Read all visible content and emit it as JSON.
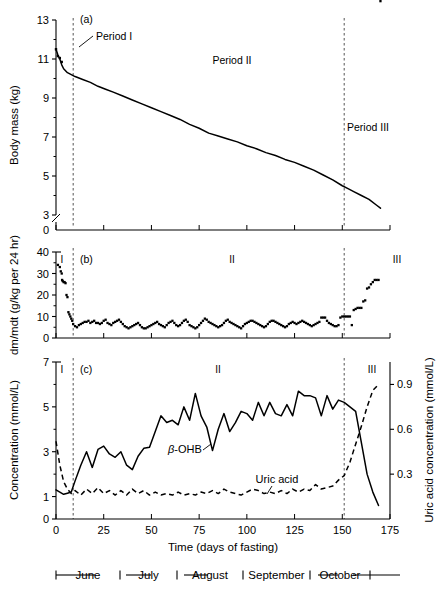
{
  "figure": {
    "panels": [
      {
        "key": "a",
        "label": "(a)",
        "ylabel": "Body mass (kg)",
        "yticks": [
          "13",
          "11",
          "9",
          "7",
          "5",
          "3",
          "0"
        ],
        "annotations": {
          "period1": "Period I",
          "period2": "Period II",
          "period3": "Period III"
        }
      },
      {
        "key": "b",
        "label": "(b)",
        "ylabel": "dm/mdt (g/kg per 24 hr)",
        "yticks": [
          "40",
          "30",
          "20",
          "10",
          "0"
        ],
        "romans": [
          "I",
          "II",
          "III"
        ]
      },
      {
        "key": "c",
        "label": "(c)",
        "ylabel": "Concentration (mmol/L)",
        "ylabel_right": "Uric acid concentration (mmol/L)",
        "yticks": [
          "7",
          "5",
          "3",
          "1",
          "0"
        ],
        "yticks_right": [
          "0.9",
          "0.6",
          "0.3"
        ],
        "romans": [
          "I",
          "II",
          "III"
        ],
        "series_labels": {
          "bohb": "-OHB",
          "bohb_prefix": "β",
          "uric": "Uric acid"
        }
      }
    ],
    "xaxis": {
      "title": "Time (days of fasting)",
      "ticks": [
        "0",
        "25",
        "50",
        "75",
        "100",
        "125",
        "150",
        "175"
      ],
      "tickvals": [
        0,
        25,
        50,
        75,
        100,
        125,
        150,
        175
      ]
    },
    "month_legend": {
      "months": [
        "June",
        "July",
        "August",
        "September",
        "October"
      ]
    },
    "colors": {
      "line": "#000000",
      "dashed_divider": "#555555",
      "axis": "#000000",
      "background": "#ffffff"
    }
  },
  "chart_data": {
    "type": "line",
    "title": "",
    "xlabel": "Time (days of fasting)",
    "xlim": [
      0,
      175
    ],
    "grid": false,
    "legend": "inline-annotations",
    "period_boundaries": [
      9,
      151
    ],
    "panels": [
      {
        "id": "a",
        "type": "line",
        "ylabel": "Body mass (kg)",
        "ylim": [
          3,
          13
        ],
        "yticks": [
          3,
          5,
          7,
          9,
          11,
          13
        ],
        "axis_break_below": 3,
        "series": [
          {
            "name": "Body mass",
            "style": "solid",
            "x": [
              0,
              1,
              2,
              3,
              4,
              6,
              8,
              10,
              14,
              18,
              22,
              26,
              30,
              35,
              40,
              45,
              50,
              55,
              60,
              65,
              70,
              75,
              80,
              85,
              90,
              95,
              100,
              105,
              110,
              115,
              120,
              125,
              130,
              135,
              140,
              145,
              150,
              153,
              156,
              160,
              164,
              168,
              170
            ],
            "values": [
              11.5,
              11.2,
              11.0,
              10.7,
              10.5,
              10.3,
              10.2,
              10.1,
              9.95,
              9.8,
              9.6,
              9.45,
              9.3,
              9.1,
              8.9,
              8.7,
              8.5,
              8.3,
              8.1,
              7.9,
              7.65,
              7.45,
              7.2,
              7.05,
              6.9,
              6.75,
              6.55,
              6.4,
              6.2,
              6.05,
              5.85,
              5.7,
              5.5,
              5.3,
              5.05,
              4.8,
              4.5,
              4.35,
              4.2,
              4.0,
              3.8,
              3.5,
              3.35
            ]
          },
          {
            "name": "Pre-fast points",
            "style": "points",
            "x": [
              0,
              1,
              2,
              3
            ],
            "values": [
              11.5,
              11.15,
              11.05,
              10.85
            ]
          }
        ]
      },
      {
        "id": "b",
        "type": "scatter",
        "ylabel": "dm/mdt (g/kg per 24 hr)",
        "ylim": [
          0,
          40
        ],
        "yticks": [
          0,
          10,
          20,
          30,
          40
        ],
        "series": [
          {
            "name": "Mass loss rate",
            "style": "points",
            "x": [
              1,
              2,
              2.5,
              3,
              3.2,
              3.5,
              4,
              4.5,
              5,
              5.5,
              6,
              6.5,
              7,
              7.5,
              8,
              8.5,
              9,
              10,
              11,
              12,
              13,
              14,
              15,
              16,
              17,
              18,
              19,
              20,
              21,
              22,
              23,
              24,
              25,
              26,
              27,
              28,
              29,
              30,
              31,
              32,
              33,
              34,
              35,
              36,
              37,
              38,
              39,
              40,
              41,
              42,
              43,
              44,
              45,
              46,
              47,
              48,
              49,
              50,
              51,
              52,
              53,
              54,
              55,
              56,
              57,
              58,
              59,
              60,
              61,
              62,
              63,
              64,
              65,
              66,
              67,
              68,
              69,
              70,
              71,
              72,
              73,
              74,
              75,
              76,
              77,
              78,
              79,
              80,
              81,
              82,
              83,
              84,
              85,
              86,
              87,
              88,
              89,
              90,
              91,
              92,
              93,
              94,
              95,
              96,
              97,
              98,
              99,
              100,
              101,
              102,
              103,
              104,
              105,
              106,
              107,
              108,
              109,
              110,
              111,
              112,
              113,
              114,
              115,
              116,
              117,
              118,
              119,
              120,
              121,
              122,
              123,
              124,
              125,
              126,
              127,
              128,
              129,
              130,
              131,
              132,
              133,
              134,
              135,
              136,
              137,
              138,
              139,
              140,
              141,
              142,
              143,
              144,
              145,
              146,
              147,
              148,
              149,
              150,
              151,
              152,
              153,
              154,
              155,
              156,
              157,
              158,
              159,
              160,
              161,
              162,
              163,
              164,
              165,
              166,
              167,
              168,
              169,
              170
            ],
            "values": [
              34,
              33,
              31,
              30,
              27,
              26.5,
              26,
              26,
              25.5,
              20,
              19,
              12,
              11,
              10,
              9,
              8,
              6.5,
              5.5,
              5,
              6,
              6.5,
              7,
              7.5,
              7.5,
              8,
              7,
              7.5,
              8,
              7,
              7,
              6.5,
              7,
              8,
              8.5,
              7,
              6.5,
              6,
              7,
              7.5,
              8,
              8.5,
              7.5,
              6.5,
              5.5,
              5,
              4.5,
              5,
              5.5,
              6,
              6.5,
              7,
              6,
              5,
              4.5,
              4.5,
              5,
              5.5,
              6,
              6.5,
              7,
              7.5,
              6.5,
              6,
              5.5,
              5,
              6,
              7,
              7.5,
              8,
              7,
              6,
              5.5,
              6,
              7,
              8,
              8.5,
              7.5,
              6,
              5.5,
              5,
              4.5,
              5,
              6,
              7,
              8,
              9,
              8.5,
              7.5,
              7,
              6.5,
              6,
              5.5,
              5,
              5.5,
              6,
              7,
              8,
              8.5,
              7.5,
              7,
              6.5,
              6,
              5.5,
              5,
              4.5,
              5.5,
              6.5,
              7,
              7.5,
              8,
              8,
              7.5,
              7,
              6.5,
              6,
              5.5,
              5,
              5.5,
              6.5,
              7.5,
              8,
              8,
              7.5,
              7,
              6.5,
              6,
              5.5,
              5,
              5.5,
              6.5,
              7,
              7.5,
              7,
              6.5,
              7,
              7.5,
              8,
              7.5,
              7,
              6.5,
              6,
              5.5,
              6,
              6.5,
              7,
              7.5,
              9.5,
              9.5,
              9.5,
              8,
              7,
              6.5,
              6,
              5.5,
              5.5,
              6,
              9.5,
              10,
              10,
              10,
              10,
              10,
              6,
              13,
              13.5,
              14,
              14,
              14,
              17,
              17.5,
              23,
              23.5,
              25,
              26,
              27,
              27,
              27
            ]
          }
        ]
      },
      {
        "id": "c",
        "type": "line",
        "ylabel": "Concentration (mmol/L)",
        "ylabel_right": "Uric acid concentration (mmol/L)",
        "ylim": [
          0,
          7
        ],
        "yticks": [
          0,
          1,
          3,
          5,
          7
        ],
        "ylim_right": [
          0,
          1.05
        ],
        "yticks_right": [
          0.3,
          0.6,
          0.9
        ],
        "series": [
          {
            "name": "β-OHB",
            "style": "solid",
            "axis": "left",
            "x": [
              0,
              2,
              4,
              6,
              8,
              10,
              13,
              16,
              19,
              22,
              25,
              28,
              31,
              34,
              37,
              40,
              43,
              46,
              49,
              52,
              55,
              58,
              61,
              64,
              67,
              70,
              73,
              76,
              79,
              82,
              85,
              88,
              91,
              94,
              97,
              100,
              103,
              106,
              109,
              112,
              115,
              118,
              121,
              124,
              127,
              130,
              133,
              136,
              139,
              142,
              145,
              148,
              151,
              154,
              157,
              160,
              163,
              166,
              169
            ],
            "values": [
              1.3,
              1.2,
              1.1,
              1.15,
              1.2,
              1.7,
              2.4,
              3.0,
              2.3,
              3.1,
              3.25,
              2.9,
              2.75,
              3.0,
              2.4,
              2.2,
              2.8,
              3.15,
              3.2,
              3.9,
              4.6,
              4.3,
              4.4,
              4.2,
              5.0,
              4.4,
              5.6,
              4.6,
              4.1,
              3.05,
              4.0,
              4.7,
              3.9,
              4.3,
              4.8,
              4.7,
              4.4,
              5.2,
              4.6,
              5.2,
              4.7,
              4.6,
              5.1,
              4.6,
              5.7,
              5.5,
              5.5,
              5.4,
              4.6,
              5.5,
              4.9,
              5.3,
              5.2,
              5.0,
              4.8,
              3.4,
              2.0,
              1.2,
              0.6
            ]
          },
          {
            "name": "Uric acid",
            "style": "dashed",
            "axis": "right",
            "x": [
              0,
              2,
              4,
              6,
              8,
              10,
              13,
              16,
              19,
              22,
              25,
              28,
              31,
              34,
              37,
              40,
              43,
              46,
              49,
              52,
              55,
              58,
              61,
              64,
              67,
              70,
              73,
              76,
              79,
              82,
              85,
              88,
              91,
              94,
              97,
              100,
              103,
              106,
              109,
              112,
              115,
              118,
              121,
              124,
              127,
              130,
              133,
              136,
              139,
              142,
              145,
              148,
              151,
              154,
              157,
              160,
              163,
              166,
              169
            ],
            "values": [
              0.52,
              0.36,
              0.25,
              0.2,
              0.17,
              0.19,
              0.16,
              0.2,
              0.17,
              0.21,
              0.17,
              0.19,
              0.16,
              0.19,
              0.16,
              0.2,
              0.17,
              0.19,
              0.16,
              0.18,
              0.16,
              0.17,
              0.16,
              0.18,
              0.16,
              0.17,
              0.16,
              0.18,
              0.17,
              0.19,
              0.17,
              0.2,
              0.18,
              0.17,
              0.16,
              0.18,
              0.2,
              0.19,
              0.17,
              0.18,
              0.17,
              0.19,
              0.17,
              0.2,
              0.18,
              0.2,
              0.19,
              0.23,
              0.2,
              0.21,
              0.22,
              0.26,
              0.29,
              0.38,
              0.5,
              0.62,
              0.75,
              0.86,
              0.9
            ]
          }
        ]
      }
    ]
  }
}
